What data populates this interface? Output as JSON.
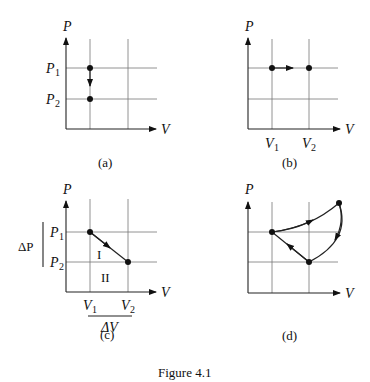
{
  "figure": {
    "caption": "Figure 4.1"
  },
  "panels": {
    "a": {
      "label": "(a)",
      "y_axis": "P",
      "x_axis": "V",
      "p1": "P",
      "p1_sub": "1",
      "p2": "P",
      "p2_sub": "2"
    },
    "b": {
      "label": "(b)",
      "y_axis": "P",
      "x_axis": "V",
      "v1": "V",
      "v1_sub": "1",
      "v2": "V",
      "v2_sub": "2"
    },
    "c": {
      "label": "(c)",
      "y_axis": "P",
      "x_axis": "V",
      "p1": "P",
      "p1_sub": "1",
      "p2": "P",
      "p2_sub": "2",
      "v1": "V",
      "v1_sub": "1",
      "v2": "V",
      "v2_sub": "2",
      "delta_p": "ΔP",
      "delta_v": "ΔV",
      "region_1": "I",
      "region_2": "II"
    },
    "d": {
      "label": "(d)",
      "y_axis": "P",
      "x_axis": "V"
    }
  }
}
